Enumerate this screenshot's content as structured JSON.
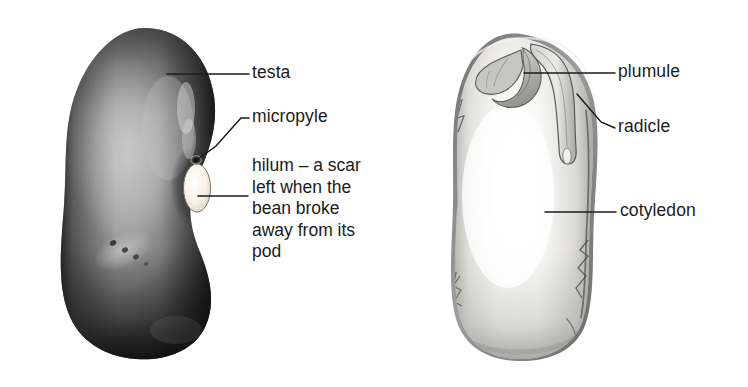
{
  "figure": {
    "kind": "biology-diagram",
    "background_color": "#ffffff",
    "width": 748,
    "height": 387
  },
  "colors": {
    "background": "#ffffff",
    "text": "#1b1b1b",
    "leader_line": "#1b1b1b",
    "testa_dark": "#1a1a1a",
    "testa_mid": "#6e6e6e",
    "testa_light": "#a8a8a8",
    "hilum_white": "#f7f3ea",
    "cotyledon_white": "#fafafa",
    "cotyledon_shade": "#d8d8d6",
    "cut_testa_rim": "#8d8d8d",
    "plumule_gray": "#b6b6b4"
  },
  "specimens": [
    {
      "id": "whole-bean",
      "name": "whole bean seed (external view)",
      "description": "dark kidney-shaped bean seen from outside",
      "bounds": {
        "x": 62,
        "y": 27,
        "width": 153,
        "height": 333
      }
    },
    {
      "id": "opened-bean",
      "name": "opened bean seed (internal view)",
      "description": "pale bean with testa removed showing cotyledon, plumule and radicle",
      "bounds": {
        "x": 455,
        "y": 33,
        "width": 140,
        "height": 327
      }
    }
  ],
  "labels": [
    {
      "id": "testa",
      "text": "testa",
      "specimen": "whole-bean",
      "text_x": 252,
      "text_y": 75,
      "leader": {
        "type": "line",
        "x1": 167,
        "y1": 74,
        "x2": 249,
        "y2": 74
      }
    },
    {
      "id": "micropyle",
      "text": "micropyle",
      "specimen": "whole-bean",
      "text_x": 252,
      "text_y": 118,
      "leader": {
        "type": "polyline",
        "points": "197,160 215,146 240,118 249,118"
      }
    },
    {
      "id": "hilum",
      "text": "hilum – a scar left when the bean broke away from its pod",
      "lines": [
        "hilum – a scar",
        "left when the",
        "bean broke",
        "away from its",
        "pod"
      ],
      "specimen": "whole-bean",
      "text_x": 252,
      "text_y": 165,
      "leader": {
        "type": "line",
        "x1": 198,
        "y1": 196,
        "x2": 248,
        "y2": 196
      }
    },
    {
      "id": "plumule",
      "text": "plumule",
      "specimen": "opened-bean",
      "text_x": 618,
      "text_y": 63,
      "leader": {
        "type": "line",
        "x1": 524,
        "y1": 73,
        "x2": 615,
        "y2": 73
      }
    },
    {
      "id": "radicle",
      "text": "radicle",
      "specimen": "opened-bean",
      "text_x": 618,
      "text_y": 118,
      "leader": {
        "type": "polyline",
        "points": "577,94 600,122 615,128"
      }
    },
    {
      "id": "cotyledon",
      "text": "cotyledon",
      "specimen": "opened-bean",
      "text_x": 620,
      "text_y": 203,
      "leader": {
        "type": "line",
        "x1": 545,
        "y1": 212,
        "x2": 616,
        "y2": 212
      }
    }
  ],
  "features": [
    {
      "id": "hilum-scar",
      "name": "hilum scar",
      "shape": "white oval",
      "cx": 197,
      "cy": 188,
      "rx": 13,
      "ry": 24
    },
    {
      "id": "micropyle-pore",
      "name": "micropyle pore",
      "shape": "small dark dot",
      "cx": 196,
      "cy": 160,
      "r": 2.2
    },
    {
      "id": "seed-blemish",
      "name": "surface blemish streak",
      "cx": 124,
      "cy": 250
    }
  ]
}
